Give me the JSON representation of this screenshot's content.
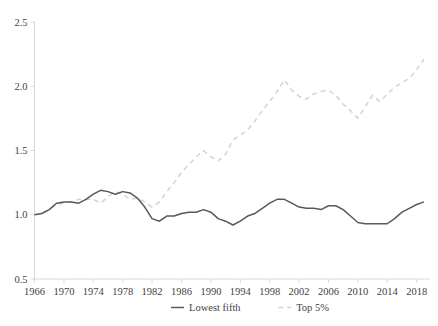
{
  "chart_data": {
    "type": "line",
    "title": "",
    "xlabel": "",
    "ylabel": "",
    "xlim": [
      1966,
      2019
    ],
    "ylim": [
      0.5,
      2.5
    ],
    "grid": false,
    "legend_position": "bottom-center",
    "ytick_labels": [
      "0.5",
      "1.0",
      "1.5",
      "2.0",
      "2.5"
    ],
    "ytick_values": [
      0.5,
      1.0,
      1.5,
      2.0,
      2.5
    ],
    "xtick_labels": [
      "1966",
      "1970",
      "1974",
      "1978",
      "1982",
      "1986",
      "1990",
      "1994",
      "1998",
      "2002",
      "2006",
      "2010",
      "2014",
      "2018"
    ],
    "xtick_values": [
      1966,
      1970,
      1974,
      1978,
      1982,
      1986,
      1990,
      1994,
      1998,
      2002,
      2006,
      2010,
      2014,
      2018
    ],
    "x": [
      1966,
      1967,
      1968,
      1969,
      1970,
      1971,
      1972,
      1973,
      1974,
      1975,
      1976,
      1977,
      1978,
      1979,
      1980,
      1981,
      1982,
      1983,
      1984,
      1985,
      1986,
      1987,
      1988,
      1989,
      1990,
      1991,
      1992,
      1993,
      1994,
      1995,
      1996,
      1997,
      1998,
      1999,
      2000,
      2001,
      2002,
      2003,
      2004,
      2005,
      2006,
      2007,
      2008,
      2009,
      2010,
      2011,
      2012,
      2013,
      2014,
      2015,
      2016,
      2017,
      2018,
      2019
    ],
    "series": [
      {
        "name": "Lowest fifth",
        "style": "solid",
        "color": "#595959",
        "values": [
          1.0,
          1.01,
          1.04,
          1.09,
          1.1,
          1.1,
          1.09,
          1.12,
          1.16,
          1.19,
          1.18,
          1.16,
          1.18,
          1.17,
          1.13,
          1.06,
          0.97,
          0.95,
          0.99,
          0.99,
          1.01,
          1.02,
          1.02,
          1.04,
          1.02,
          0.97,
          0.95,
          0.92,
          0.95,
          0.99,
          1.01,
          1.05,
          1.09,
          1.12,
          1.12,
          1.09,
          1.06,
          1.05,
          1.05,
          1.04,
          1.07,
          1.07,
          1.04,
          0.99,
          0.94,
          0.93,
          0.93,
          0.93,
          0.93,
          0.97,
          1.02,
          1.05,
          1.08,
          1.1
        ]
      },
      {
        "name": "Top 5%",
        "style": "dashed",
        "color": "#d3d3d3",
        "values": [
          1.0,
          1.01,
          1.04,
          1.08,
          1.09,
          1.1,
          1.12,
          1.12,
          1.12,
          1.09,
          1.14,
          1.18,
          1.16,
          1.12,
          1.13,
          1.1,
          1.06,
          1.1,
          1.18,
          1.25,
          1.33,
          1.39,
          1.45,
          1.5,
          1.45,
          1.42,
          1.47,
          1.58,
          1.62,
          1.66,
          1.73,
          1.81,
          1.88,
          1.96,
          2.05,
          1.97,
          1.92,
          1.9,
          1.94,
          1.96,
          1.97,
          1.93,
          1.86,
          1.81,
          1.75,
          1.84,
          1.93,
          1.88,
          1.94,
          1.99,
          2.03,
          2.06,
          2.13,
          2.21
        ]
      }
    ]
  },
  "legend": {
    "items": [
      {
        "label": "Lowest fifth",
        "style": "solid",
        "color": "#595959"
      },
      {
        "label": "Top 5%",
        "style": "dashed",
        "color": "#d3d3d3"
      }
    ]
  }
}
